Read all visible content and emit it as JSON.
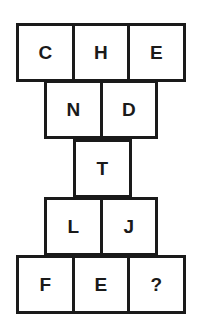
{
  "puzzle": {
    "rows": [
      {
        "cells": [
          "C",
          "H",
          "E"
        ]
      },
      {
        "cells": [
          "N",
          "D"
        ]
      },
      {
        "cells": [
          "T"
        ]
      },
      {
        "cells": [
          "L",
          "J"
        ]
      },
      {
        "cells": [
          "F",
          "E",
          "?"
        ]
      }
    ],
    "border_color": "#1a1a1a",
    "text_color": "#1a1a1a",
    "background": "#ffffff"
  }
}
